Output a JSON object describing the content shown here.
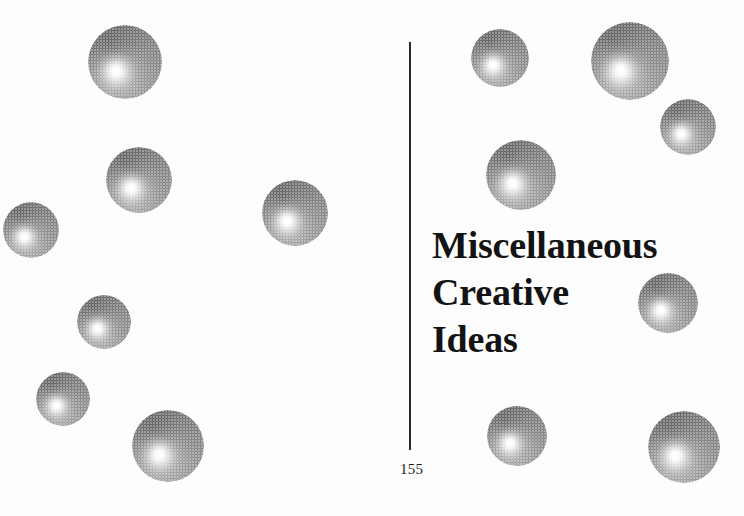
{
  "page": {
    "width": 744,
    "height": 516,
    "background_color": "#fdfdfd",
    "ink_color": "#131313"
  },
  "headline": {
    "lines": [
      "Miscellaneous",
      "Creative",
      "Ideas"
    ],
    "full_text": "Miscellaneous Creative Ideas",
    "x": 432,
    "y": 222,
    "font_size_px": 38,
    "line_height_px": 47,
    "color": "#131313"
  },
  "folio": {
    "page_number": "155",
    "x": 400,
    "y": 461,
    "font_size_px": 15,
    "color": "#1d1d1d"
  },
  "divider": {
    "label": "vertical-rule",
    "x": 409,
    "y_top": 42,
    "y_bottom": 450,
    "thickness": 2,
    "color": "#2a2a2a"
  },
  "decoration": {
    "name": "halftone-spheres",
    "count": 14,
    "shading": {
      "highlight_position": "38% 62%",
      "highlight_color": "#ffffff",
      "mid_color": "#9e9e9e",
      "shadow_color": "#6e6e6e",
      "rim_color": "#7a7a7a",
      "screen": "halftone-dot"
    },
    "spheres": [
      {
        "id": 1,
        "cx": 125,
        "cy": 62,
        "r": 37
      },
      {
        "id": 2,
        "cx": 139,
        "cy": 180,
        "r": 33
      },
      {
        "id": 3,
        "cx": 31,
        "cy": 230,
        "r": 28
      },
      {
        "id": 4,
        "cx": 295,
        "cy": 213,
        "r": 33
      },
      {
        "id": 5,
        "cx": 104,
        "cy": 322,
        "r": 27
      },
      {
        "id": 6,
        "cx": 63,
        "cy": 399,
        "r": 27
      },
      {
        "id": 7,
        "cx": 168,
        "cy": 446,
        "r": 36
      },
      {
        "id": 8,
        "cx": 500,
        "cy": 58,
        "r": 29
      },
      {
        "id": 9,
        "cx": 630,
        "cy": 61,
        "r": 39
      },
      {
        "id": 10,
        "cx": 688,
        "cy": 127,
        "r": 28
      },
      {
        "id": 11,
        "cx": 521,
        "cy": 175,
        "r": 35
      },
      {
        "id": 12,
        "cx": 668,
        "cy": 303,
        "r": 30
      },
      {
        "id": 13,
        "cx": 517,
        "cy": 436,
        "r": 30
      },
      {
        "id": 14,
        "cx": 684,
        "cy": 447,
        "r": 36
      }
    ]
  }
}
